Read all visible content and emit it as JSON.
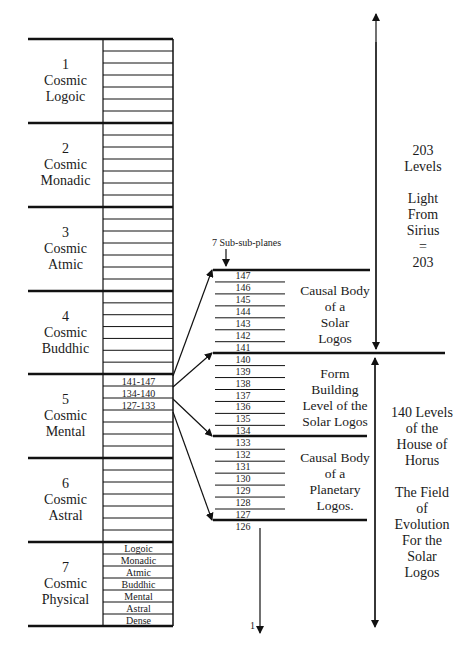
{
  "diagram": {
    "cosmic_planes": [
      {
        "number": "1",
        "line1": "Cosmic",
        "line2": "Logoic"
      },
      {
        "number": "2",
        "line1": "Cosmic",
        "line2": "Monadic"
      },
      {
        "number": "3",
        "line1": "Cosmic",
        "line2": "Atmic"
      },
      {
        "number": "4",
        "line1": "Cosmic",
        "line2": "Buddhic"
      },
      {
        "number": "5",
        "line1": "Cosmic",
        "line2": "Mental"
      },
      {
        "number": "6",
        "line1": "Cosmic",
        "line2": "Astral"
      },
      {
        "number": "7",
        "line1": "Cosmic",
        "line2": "Physical"
      }
    ],
    "mental_subplanes": [
      "141-147",
      "134-140",
      "127-133"
    ],
    "physical_subplanes": [
      "Logoic",
      "Monadic",
      "Atmic",
      "Buddhic",
      "Mental",
      "Astral",
      "Dense"
    ],
    "subsub_label": "7 Sub-sub-planes",
    "levels": [
      "147",
      "146",
      "145",
      "144",
      "143",
      "142",
      "141",
      "140",
      "139",
      "138",
      "137",
      "136",
      "135",
      "134",
      "133",
      "132",
      "131",
      "130",
      "129",
      "128",
      "127",
      "126"
    ],
    "bottom_level": "1",
    "blocks": [
      {
        "lines": [
          "Causal Body",
          "of a",
          "Solar",
          "Logos"
        ]
      },
      {
        "lines": [
          "Form",
          "Building",
          "Level of the",
          "Solar Logos"
        ]
      },
      {
        "lines": [
          "Causal Body",
          "of a",
          "Planetary",
          "Logos."
        ]
      }
    ],
    "upper_side": {
      "lines": [
        "203",
        "Levels",
        "",
        "Light",
        "From",
        "Sirius",
        "=",
        "203"
      ]
    },
    "lower_side": {
      "lines": [
        "140 Levels",
        "of the",
        "House of",
        "Horus",
        "",
        "The Field",
        "of",
        "Evolution",
        "For the",
        "Solar",
        "Logos"
      ]
    }
  }
}
